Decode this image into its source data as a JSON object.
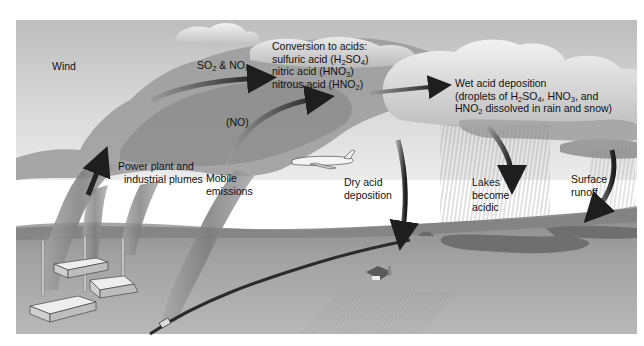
{
  "diagram": {
    "labels": {
      "wind": "Wind",
      "so2_nox": {
        "parts": [
          "SO",
          "2",
          " & NO",
          "x"
        ]
      },
      "no": "(NO)",
      "conversion": {
        "heading": "Conversion to acids:",
        "line1": {
          "parts": [
            "sulfuric acid (H",
            "2",
            "SO",
            "4",
            ")"
          ]
        },
        "line2": {
          "parts": [
            "nitric acid (HNO",
            "3",
            ")"
          ]
        },
        "line3": {
          "parts": [
            "nitrous acid (HNO",
            "2",
            ")"
          ]
        }
      },
      "wet_deposition": {
        "line1": "Wet acid deposition",
        "line2": {
          "parts": [
            "(droplets of H",
            "2",
            "SO",
            "4",
            ", HNO",
            "3",
            ", and"
          ]
        },
        "line3": {
          "parts": [
            "HNO",
            "2",
            " dissolved in rain and snow)"
          ]
        }
      },
      "power_plant": {
        "line1": "Power plant and",
        "line2": "industrial plumes"
      },
      "mobile": {
        "line1": "Mobile",
        "line2": "emissions"
      },
      "dry_deposition": {
        "line1": "Dry acid",
        "line2": "deposition"
      },
      "lakes": {
        "line1": "Lakes",
        "line2": "become",
        "line3": "acidic"
      },
      "runoff": {
        "line1": "Surface",
        "line2": "runoff"
      }
    },
    "elements": [
      "sky",
      "clouds",
      "smoke-plumes",
      "factories",
      "car-on-road",
      "airplane",
      "rain",
      "lakes",
      "farm",
      "fields",
      "arrows"
    ],
    "colors": {
      "sky": "#c9c9c9",
      "cloud": "#e4e4e4",
      "plume": "#8f8f8f",
      "ground": "#9a9a9a",
      "arrow": "#2a2a2a"
    }
  }
}
